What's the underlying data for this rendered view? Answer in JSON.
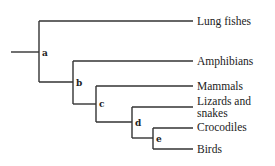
{
  "diagram": {
    "type": "cladogram",
    "nodes": [
      {
        "id": "a",
        "label": "a"
      },
      {
        "id": "b",
        "label": "b"
      },
      {
        "id": "c",
        "label": "c"
      },
      {
        "id": "d",
        "label": "d"
      },
      {
        "id": "e",
        "label": "e"
      }
    ],
    "taxa": [
      {
        "name": "Lung fishes"
      },
      {
        "name": "Amphibians"
      },
      {
        "name": "Mammals"
      },
      {
        "name": "Lizards and snakes",
        "line1": "Lizards and",
        "line2": "snakes"
      },
      {
        "name": "Crocodiles"
      },
      {
        "name": "Birds"
      }
    ],
    "structure": "(Lung fishes,(Amphibians,(Mammals,(Lizards and snakes,(Crocodiles,Birds)e)d)c)b)a"
  }
}
